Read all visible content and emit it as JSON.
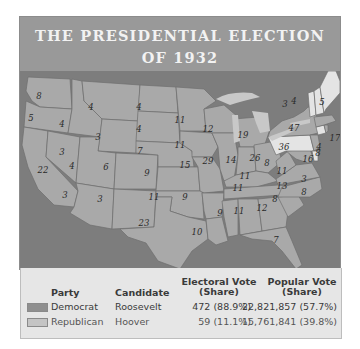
{
  "header": {
    "title_line1": "THE PRESIDENTIAL ELECTION",
    "title_line2": "OF 1932"
  },
  "colors": {
    "header_bg": "#999999",
    "map_bg": "#7d7d7d",
    "democrat": "#a9a9a9",
    "republican": "#e4e4e4",
    "legend_bg": "#e6e6e6"
  },
  "map": {
    "electoral_votes": {
      "WA": "8",
      "OR": "5",
      "CA": "22",
      "ID": "4",
      "NV": "3",
      "MT": "4",
      "WY": "3",
      "UT": "4",
      "AZ": "3",
      "CO": "6",
      "NM": "3",
      "ND": "4",
      "SD": "4",
      "NE": "7",
      "KS": "9",
      "OK": "11",
      "TX": "23",
      "MN": "11",
      "IA": "11",
      "MO": "15",
      "AR": "9",
      "LA": "10",
      "WI": "12",
      "IL": "29",
      "MI": "19",
      "IN": "14",
      "OH": "26",
      "KY": "11",
      "TN": "11",
      "MS": "9",
      "AL": "11",
      "GA": "12",
      "FL": "7",
      "SC": "8",
      "NC": "13",
      "VA": "11",
      "WV": "8",
      "PA": "36",
      "NY": "47",
      "VT": "3",
      "NH": "4",
      "ME": "5",
      "MA": "17",
      "RI": "4",
      "CT": "8",
      "NJ": "16",
      "DE": "3",
      "MD": "8"
    }
  },
  "legend": {
    "headers": {
      "party": "Party",
      "candidate": "Candidate",
      "electoral_line1": "Electoral Vote",
      "electoral_line2": "(Share)",
      "popular_line1": "Popular Vote",
      "popular_line2": "(Share)"
    },
    "rows": [
      {
        "party": "Democrat",
        "candidate": "Roosevelt",
        "electoral": "472 (88.9%)",
        "popular": "22,821,857 (57.7%)"
      },
      {
        "party": "Republican",
        "candidate": "Hoover",
        "electoral": "59 (11.1%)",
        "popular": "15,761,841 (39.8%)"
      }
    ]
  }
}
